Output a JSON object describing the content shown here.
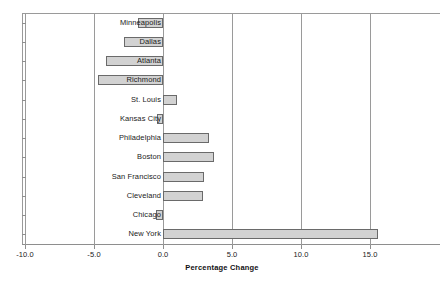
{
  "chart_data": {
    "type": "bar",
    "orientation": "horizontal",
    "title": "",
    "subtitle": "",
    "xlabel": "Percentage Change",
    "ylabel": "",
    "xlim": [
      -10.8,
      19.5
    ],
    "xticks": [
      -10.0,
      -5.0,
      0.0,
      5.0,
      10.0,
      15.0
    ],
    "xtick_labels": [
      "-10.0",
      "-5.0",
      "0.0",
      "5.0",
      "10.0",
      "15.0"
    ],
    "grid": "vertical",
    "legend": "none",
    "zero_line": 0.0,
    "bar_fill": "#d2d2d2",
    "bar_edge": "#6a6a6a",
    "categories": [
      "Minneapolis",
      "Dallas",
      "Atlanta",
      "Richmond",
      "St. Louis",
      "Kansas City",
      "Philadelphia",
      "Boston",
      "San Francisco",
      "Cleveland",
      "Chicago",
      "New York"
    ],
    "values": [
      -1.8,
      -2.8,
      -4.1,
      -4.7,
      1.0,
      -0.4,
      3.3,
      3.7,
      3.0,
      2.9,
      -0.5,
      15.6
    ]
  }
}
